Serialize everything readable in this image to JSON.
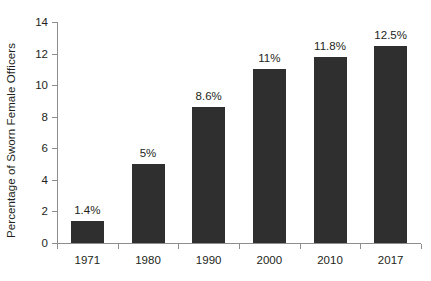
{
  "chart_data": {
    "type": "bar",
    "title": "",
    "subtitle": "",
    "xlabel": "",
    "ylabel": "Percentage of Sworn Female Officers",
    "categories": [
      "1971",
      "1980",
      "1990",
      "2000",
      "2010",
      "2017"
    ],
    "values": [
      1.4,
      5,
      8.6,
      11,
      11.8,
      12.5
    ],
    "data_labels": [
      "1.4%",
      "5%",
      "8.6%",
      "11%",
      "11.8%",
      "12.5%"
    ],
    "ylim": [
      0,
      14
    ],
    "ytick_values": [
      0,
      2,
      4,
      6,
      8,
      10,
      12,
      14
    ],
    "ytick_labels": [
      "0",
      "2",
      "4",
      "6",
      "8",
      "10",
      "12",
      "14"
    ],
    "grid": false,
    "legend": null,
    "legend_position": "none",
    "series": [
      {
        "name": "Percentage of Sworn Female Officers",
        "values": [
          1.4,
          5,
          8.6,
          11,
          11.8,
          12.5
        ],
        "color": "#2f2f2f"
      }
    ],
    "colors": {
      "bar": "#2f2f2f",
      "axis": "#8d8d8d",
      "text": "#231f20",
      "background": "#ffffff"
    }
  }
}
